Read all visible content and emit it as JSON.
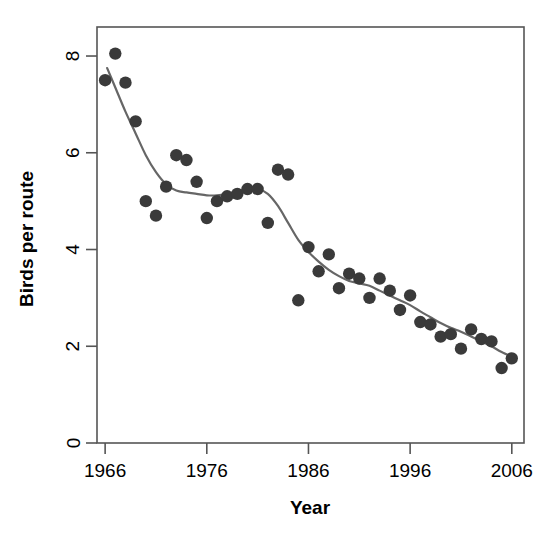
{
  "chart_data": {
    "type": "scatter",
    "title": "",
    "xlabel": "Year",
    "ylabel": "Birds per route",
    "xlim": [
      1965.2,
      2007.2
    ],
    "ylim": [
      0,
      8.6
    ],
    "grid": false,
    "legend": null,
    "x_ticks": [
      1966,
      1976,
      1986,
      1996,
      2006
    ],
    "y_ticks": [
      0,
      2,
      4,
      6,
      8
    ],
    "x_tick_labels": [
      "1966",
      "1976",
      "1986",
      "1996",
      "2006"
    ],
    "y_tick_labels": [
      "0",
      "2",
      "4",
      "6",
      "8"
    ],
    "point_color": "#3a3a3a",
    "line_color": "#666666",
    "frame_color": "#555555",
    "x": [
      1966,
      1967,
      1968,
      1969,
      1970,
      1971,
      1972,
      1973,
      1974,
      1975,
      1976,
      1977,
      1978,
      1979,
      1980,
      1981,
      1982,
      1983,
      1984,
      1985,
      1986,
      1987,
      1988,
      1989,
      1990,
      1991,
      1992,
      1993,
      1994,
      1995,
      1996,
      1997,
      1998,
      1999,
      2000,
      2001,
      2002,
      2003,
      2004,
      2005,
      2006
    ],
    "values": [
      7.5,
      8.05,
      7.45,
      6.65,
      5.0,
      4.7,
      5.3,
      5.95,
      5.85,
      5.4,
      4.65,
      5.0,
      5.1,
      5.15,
      5.25,
      5.25,
      4.55,
      5.65,
      5.55,
      2.95,
      4.05,
      3.55,
      3.9,
      3.2,
      3.5,
      3.4,
      3.0,
      3.4,
      3.15,
      2.75,
      3.05,
      2.5,
      2.45,
      2.2,
      2.25,
      1.95,
      2.35,
      2.15,
      2.1,
      1.55,
      1.75
    ],
    "series": [
      {
        "name": "Birds per route",
        "type": "scatter",
        "x": [
          1966,
          1967,
          1968,
          1969,
          1970,
          1971,
          1972,
          1973,
          1974,
          1975,
          1976,
          1977,
          1978,
          1979,
          1980,
          1981,
          1982,
          1983,
          1984,
          1985,
          1986,
          1987,
          1988,
          1989,
          1990,
          1991,
          1992,
          1993,
          1994,
          1995,
          1996,
          1997,
          1998,
          1999,
          2000,
          2001,
          2002,
          2003,
          2004,
          2005,
          2006
        ],
        "values": [
          7.5,
          8.05,
          7.45,
          6.65,
          5.0,
          4.7,
          5.3,
          5.95,
          5.85,
          5.4,
          4.65,
          5.0,
          5.1,
          5.15,
          5.25,
          5.25,
          4.55,
          5.65,
          5.55,
          2.95,
          4.05,
          3.55,
          3.9,
          3.2,
          3.5,
          3.4,
          3.0,
          3.4,
          3.15,
          2.75,
          3.05,
          2.5,
          2.45,
          2.2,
          2.25,
          1.95,
          2.35,
          2.15,
          2.1,
          1.55,
          1.75
        ]
      },
      {
        "name": "smoothed trend",
        "type": "line",
        "x": [
          1966.2,
          1967,
          1968,
          1969,
          1970,
          1971,
          1972,
          1973,
          1974,
          1975,
          1976,
          1977,
          1978,
          1979,
          1980,
          1981,
          1982,
          1983,
          1984,
          1985,
          1986,
          1987,
          1988,
          1989,
          1990,
          1991,
          1992,
          1993,
          1994,
          1995,
          1996,
          1997,
          1998,
          1999,
          2000,
          2001,
          2002,
          2003,
          2004,
          2005,
          2006.4
        ],
        "values": [
          7.75,
          7.35,
          6.85,
          6.4,
          5.95,
          5.6,
          5.35,
          5.22,
          5.18,
          5.15,
          5.12,
          5.12,
          5.15,
          5.2,
          5.25,
          5.25,
          5.15,
          4.9,
          4.55,
          4.2,
          3.95,
          3.75,
          3.58,
          3.45,
          3.35,
          3.3,
          3.25,
          3.15,
          3.05,
          2.95,
          2.85,
          2.72,
          2.6,
          2.48,
          2.38,
          2.3,
          2.2,
          2.1,
          2.0,
          1.88,
          1.75
        ]
      }
    ]
  },
  "axes": {
    "x_title": "Year",
    "y_title": "Birds per route"
  }
}
